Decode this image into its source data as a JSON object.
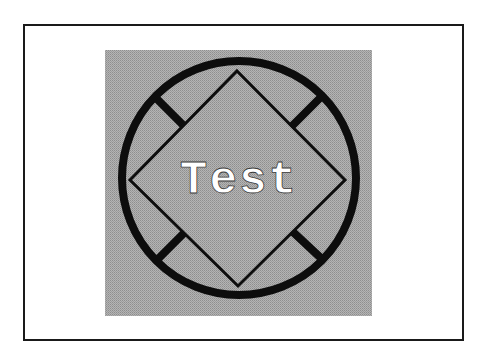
{
  "figure": {
    "label_text": "Test",
    "colors": {
      "background": "#ffffff",
      "frame_border": "#1a1a1a",
      "panel_fill": "#a8a8a8",
      "stroke": "#0d0d0d",
      "label_fill": "#ffffff",
      "label_outline": "#3a3a3a"
    },
    "shapes": {
      "panel": {
        "x": 105,
        "y": 50,
        "width": 267,
        "height": 266
      },
      "circle": {
        "cx": 239,
        "cy": 178,
        "r": 117,
        "stroke_width": 8
      },
      "diamond": {
        "points": "237,71 345,180 238,286 130,180",
        "stroke_width": 3
      },
      "connectors": [
        {
          "name": "top-left",
          "x1": 153,
          "y1": 95,
          "x2": 183,
          "y2": 125
        },
        {
          "name": "top-right",
          "x1": 322,
          "y1": 96,
          "x2": 292,
          "y2": 126
        },
        {
          "name": "bottom-left",
          "x1": 155,
          "y1": 262,
          "x2": 183,
          "y2": 235
        },
        {
          "name": "bottom-right",
          "x1": 323,
          "y1": 260,
          "x2": 294,
          "y2": 233
        }
      ]
    }
  }
}
